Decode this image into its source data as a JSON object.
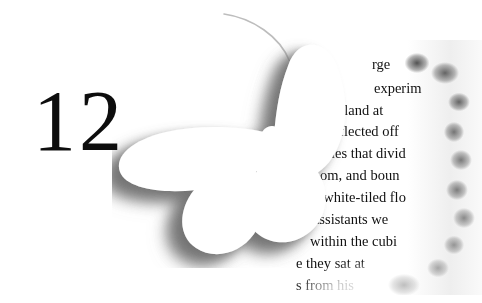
{
  "page": {
    "background_color": "#ffffff",
    "width": 482,
    "height": 303
  },
  "chapter": {
    "number": "12",
    "color": "#0d0d0d"
  },
  "butterfly": {
    "name": "butterfly-cutout",
    "fill_color": "#ffffff",
    "shadow_color": "#8a8a8a",
    "description": "white butterfly silhouette cutout with soft grey drop shadow"
  },
  "torn_page": {
    "edge": "ragged-torn-right-edge",
    "shadow_color": "#2c2c2c",
    "text_color": "#101010",
    "lines": [
      {
        "text": "Dr.",
        "x": 14,
        "y": 16,
        "size": 14.5
      },
      {
        "text": "rge",
        "x": 86,
        "y": 16,
        "size": 14.5
      },
      {
        "text": "the",
        "x": 38,
        "y": 40,
        "size": 14.5
      },
      {
        "text": "experim",
        "x": 88,
        "y": 40,
        "size": 14.5
      },
      {
        "text": "th  Leland  at",
        "x": 28,
        "y": 62,
        "size": 14.5
      },
      {
        "text": "ht reflected off",
        "x": 27,
        "y": 83,
        "size": 14.5
      },
      {
        "text": "ubicles that divid",
        "x": 20,
        "y": 105,
        "size": 14.5
      },
      {
        "text": "room,   and   boun",
        "x": 22,
        "y": 127,
        "size": 14.5
      },
      {
        "text": "the  white-tiled  flo",
        "x": 16,
        "y": 149,
        "size": 14.5
      },
      {
        "text": "ral    assistants    we",
        "x": 8,
        "y": 171,
        "size": 14.5
      },
      {
        "text": "within  the  cubi",
        "x": 24,
        "y": 193,
        "size": 14.5
      },
      {
        "text": "e  they   sat   at",
        "x": 10,
        "y": 215,
        "size": 14.5
      },
      {
        "text": "s from his",
        "x": 10,
        "y": 237,
        "size": 14.5
      }
    ]
  }
}
